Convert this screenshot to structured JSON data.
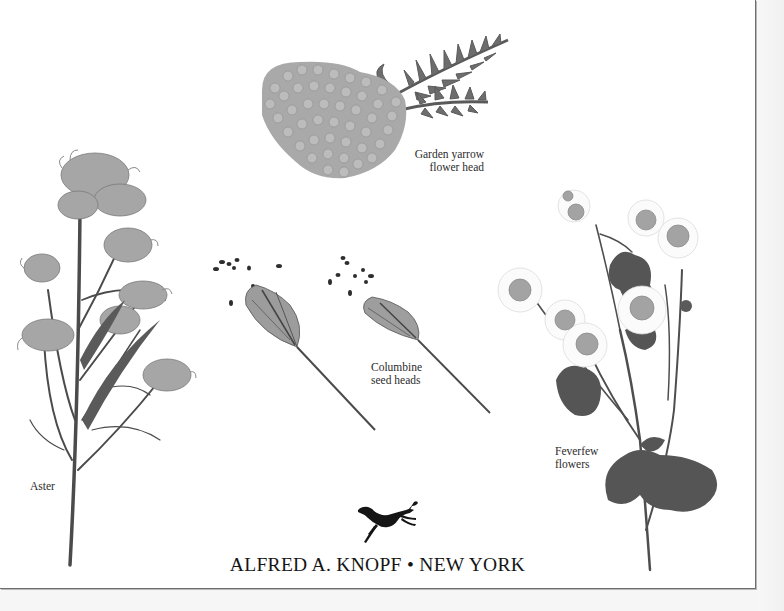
{
  "page": {
    "type": "book-title-page",
    "colors": {
      "paper": "#ffffff",
      "margin": "#f6f6f6",
      "border": "#6e6e6e",
      "text": "#151515"
    }
  },
  "captions": {
    "garden_yarrow": "Garden yarrow\nflower head",
    "columbine": "Columbine\nseed heads",
    "feverfew": "Feverfew\nflowers",
    "aster": "Aster"
  },
  "illustrations": [
    {
      "name": "garden-yarrow-flower-head",
      "label": "Garden yarrow flower head"
    },
    {
      "name": "columbine-seed-heads",
      "label": "Columbine seed heads"
    },
    {
      "name": "feverfew-flowers",
      "label": "Feverfew flowers"
    },
    {
      "name": "aster",
      "label": "Aster"
    }
  ],
  "imprint": {
    "publisher": "ALFRED A. KNOPF",
    "separator": "•",
    "city": "NEW YORK",
    "full": "ALFRED A. KNOPF • NEW YORK",
    "logo": "borzoi-dog-icon"
  }
}
